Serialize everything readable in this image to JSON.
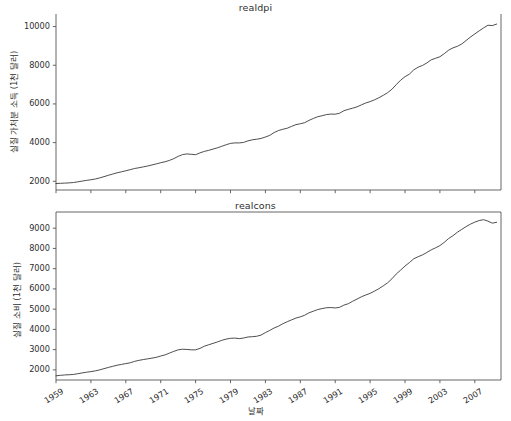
{
  "figure": {
    "background": "#ffffff",
    "line_color": "#3a3a3a",
    "axis_color": "#555555",
    "width": 511,
    "height": 421
  },
  "xlabel": "날짜",
  "chart_data": [
    {
      "type": "line",
      "title": "realdpi",
      "xlabel": "",
      "ylabel": "실질 가처분 소득 (1천 달러)",
      "xlim": [
        1959.0,
        2010.0
      ],
      "ylim": [
        1550,
        10650
      ],
      "grid": false,
      "legend": "none",
      "xticks": [
        1959,
        1963,
        1967,
        1971,
        1975,
        1979,
        1983,
        1987,
        1991,
        1995,
        1999,
        2003,
        2007
      ],
      "yticks": [
        2000,
        4000,
        6000,
        8000,
        10000
      ],
      "x": [
        1959.0,
        1959.5,
        1960.0,
        1960.5,
        1961.0,
        1961.5,
        1962.0,
        1962.5,
        1963.0,
        1963.5,
        1964.0,
        1964.5,
        1965.0,
        1965.5,
        1966.0,
        1966.5,
        1967.0,
        1967.5,
        1968.0,
        1968.5,
        1969.0,
        1969.5,
        1970.0,
        1970.5,
        1971.0,
        1971.5,
        1972.0,
        1972.5,
        1973.0,
        1973.5,
        1974.0,
        1974.5,
        1975.0,
        1975.5,
        1976.0,
        1976.5,
        1977.0,
        1977.5,
        1978.0,
        1978.5,
        1979.0,
        1979.5,
        1980.0,
        1980.5,
        1981.0,
        1981.5,
        1982.0,
        1982.5,
        1983.0,
        1983.5,
        1984.0,
        1984.5,
        1985.0,
        1985.5,
        1986.0,
        1986.5,
        1987.0,
        1987.5,
        1988.0,
        1988.5,
        1989.0,
        1989.5,
        1990.0,
        1990.5,
        1991.0,
        1991.5,
        1992.0,
        1992.5,
        1993.0,
        1993.5,
        1994.0,
        1994.5,
        1995.0,
        1995.5,
        1996.0,
        1996.5,
        1997.0,
        1997.5,
        1998.0,
        1998.5,
        1999.0,
        1999.5,
        2000.0,
        2000.5,
        2001.0,
        2001.5,
        2002.0,
        2002.5,
        2003.0,
        2003.5,
        2004.0,
        2004.5,
        2005.0,
        2005.5,
        2006.0,
        2006.5,
        2007.0,
        2007.5,
        2008.0,
        2008.5,
        2009.0,
        2009.5
      ],
      "y": [
        1886,
        1896,
        1906,
        1918,
        1938,
        1972,
        2010,
        2048,
        2080,
        2118,
        2175,
        2240,
        2310,
        2375,
        2440,
        2490,
        2545,
        2600,
        2660,
        2700,
        2745,
        2790,
        2845,
        2900,
        2960,
        3010,
        3080,
        3170,
        3290,
        3380,
        3415,
        3395,
        3375,
        3470,
        3545,
        3600,
        3665,
        3730,
        3810,
        3890,
        3960,
        3985,
        3985,
        4010,
        4090,
        4145,
        4175,
        4215,
        4290,
        4375,
        4520,
        4625,
        4690,
        4745,
        4840,
        4930,
        4975,
        5030,
        5150,
        5250,
        5340,
        5390,
        5450,
        5475,
        5470,
        5520,
        5650,
        5720,
        5780,
        5850,
        5950,
        6050,
        6120,
        6210,
        6320,
        6445,
        6580,
        6760,
        7000,
        7230,
        7410,
        7540,
        7760,
        7900,
        7990,
        8120,
        8280,
        8360,
        8440,
        8600,
        8780,
        8900,
        8980,
        9100,
        9280,
        9460,
        9620,
        9780,
        9930,
        10070,
        10050,
        10130
      ]
    },
    {
      "type": "line",
      "title": "realcons",
      "xlabel": "날짜",
      "ylabel": "실질 소비 (1천 달러)",
      "xlim": [
        1959.0,
        2010.0
      ],
      "ylim": [
        1500,
        9800
      ],
      "grid": false,
      "legend": "none",
      "xticks": [
        1959,
        1963,
        1967,
        1971,
        1975,
        1979,
        1983,
        1987,
        1991,
        1995,
        1999,
        2003,
        2007
      ],
      "yticks": [
        2000,
        3000,
        4000,
        5000,
        6000,
        7000,
        8000,
        9000
      ],
      "x": [
        1959.0,
        1959.5,
        1960.0,
        1960.5,
        1961.0,
        1961.5,
        1962.0,
        1962.5,
        1963.0,
        1963.5,
        1964.0,
        1964.5,
        1965.0,
        1965.5,
        1966.0,
        1966.5,
        1967.0,
        1967.5,
        1968.0,
        1968.5,
        1969.0,
        1969.5,
        1970.0,
        1970.5,
        1971.0,
        1971.5,
        1972.0,
        1972.5,
        1973.0,
        1973.5,
        1974.0,
        1974.5,
        1975.0,
        1975.5,
        1976.0,
        1976.5,
        1977.0,
        1977.5,
        1978.0,
        1978.5,
        1979.0,
        1979.5,
        1980.0,
        1980.5,
        1981.0,
        1981.5,
        1982.0,
        1982.5,
        1983.0,
        1983.5,
        1984.0,
        1984.5,
        1985.0,
        1985.5,
        1986.0,
        1986.5,
        1987.0,
        1987.5,
        1988.0,
        1988.5,
        1989.0,
        1989.5,
        1990.0,
        1990.5,
        1991.0,
        1991.5,
        1992.0,
        1992.5,
        1993.0,
        1993.5,
        1994.0,
        1994.5,
        1995.0,
        1995.5,
        1996.0,
        1996.5,
        1997.0,
        1997.5,
        1998.0,
        1998.5,
        1999.0,
        1999.5,
        2000.0,
        2000.5,
        2001.0,
        2001.5,
        2002.0,
        2002.5,
        2003.0,
        2003.5,
        2004.0,
        2004.5,
        2005.0,
        2005.5,
        2006.0,
        2006.5,
        2007.0,
        2007.5,
        2008.0,
        2008.5,
        2009.0,
        2009.5
      ],
      "y": [
        1707,
        1730,
        1750,
        1760,
        1775,
        1810,
        1850,
        1885,
        1915,
        1950,
        2000,
        2060,
        2120,
        2175,
        2230,
        2270,
        2310,
        2350,
        2420,
        2470,
        2510,
        2545,
        2580,
        2620,
        2685,
        2740,
        2830,
        2915,
        2990,
        3020,
        3010,
        2990,
        2990,
        3060,
        3170,
        3240,
        3310,
        3380,
        3460,
        3520,
        3560,
        3570,
        3545,
        3575,
        3625,
        3640,
        3660,
        3720,
        3840,
        3950,
        4070,
        4160,
        4280,
        4380,
        4470,
        4560,
        4620,
        4700,
        4820,
        4900,
        4980,
        5030,
        5070,
        5080,
        5060,
        5090,
        5200,
        5270,
        5390,
        5500,
        5610,
        5700,
        5780,
        5890,
        6010,
        6150,
        6300,
        6500,
        6740,
        6930,
        7130,
        7300,
        7490,
        7590,
        7680,
        7800,
        7930,
        8030,
        8140,
        8300,
        8490,
        8630,
        8800,
        8940,
        9080,
        9200,
        9300,
        9380,
        9420,
        9350,
        9250,
        9290
      ]
    }
  ]
}
